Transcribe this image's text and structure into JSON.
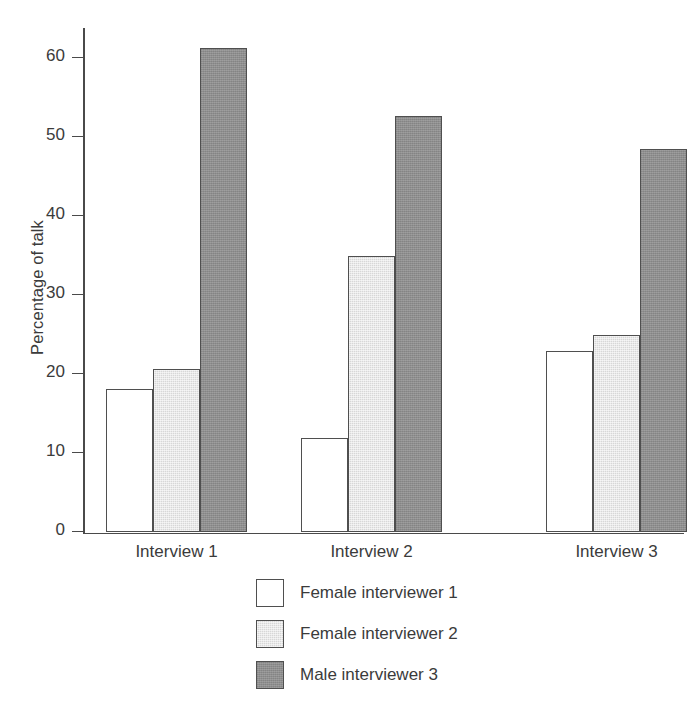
{
  "chart_data": {
    "type": "bar",
    "title": "",
    "xlabel": "",
    "ylabel": "Percentage of talk",
    "categories": [
      "Interview 1",
      "Interview 2",
      "Interview 3"
    ],
    "series": [
      {
        "name": "Female interviewer 1",
        "color": "#ffffff",
        "values": [
          18.2,
          12.0,
          23.0
        ]
      },
      {
        "name": "Female interviewer 2",
        "color": "#d7d7d7",
        "values": [
          20.7,
          35.0,
          25.0
        ]
      },
      {
        "name": "Male interviewer 3",
        "color": "#8e8e8e",
        "values": [
          61.3,
          52.7,
          48.5
        ]
      }
    ],
    "ylim": [
      0,
      63.8
    ],
    "yticks": [
      0,
      10,
      20,
      30,
      40,
      50,
      60
    ],
    "ytick_labels": [
      "0",
      "10",
      "20",
      "30",
      "40",
      "50",
      "60"
    ],
    "grid": false,
    "legend_position": "below",
    "legend_entries": [
      "Female interviewer 1",
      "Female interviewer 2",
      "Male interviewer 3"
    ],
    "axis_color": "#4a4a4a",
    "bar_edge_color": "#4f4f4f",
    "text_color": "#3b3b3b",
    "background": "#ffffff"
  }
}
